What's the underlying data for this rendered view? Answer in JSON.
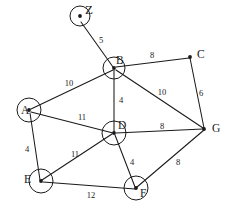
{
  "diagram": {
    "stroke_color": "#1a1a1a",
    "background_color": "#ffffff",
    "nodes": [
      {
        "id": "Z",
        "label": "Z",
        "x": 80,
        "y": 16,
        "shape": "circle",
        "radius": 10,
        "label_x": 85,
        "label_y": 11
      },
      {
        "id": "B",
        "label": "B",
        "x": 114,
        "y": 68,
        "shape": "circle",
        "radius": 11,
        "label_x": 116,
        "label_y": 61
      },
      {
        "id": "C",
        "label": "C",
        "x": 190,
        "y": 57,
        "shape": "dot",
        "radius": 0,
        "label_x": 197,
        "label_y": 55
      },
      {
        "id": "A",
        "label": "A",
        "x": 29,
        "y": 110,
        "shape": "circle",
        "radius": 12,
        "label_x": 21,
        "label_y": 111
      },
      {
        "id": "D",
        "label": "D",
        "x": 114,
        "y": 133,
        "shape": "circle",
        "radius": 12,
        "label_x": 118,
        "label_y": 126
      },
      {
        "id": "G",
        "label": "G",
        "x": 204,
        "y": 129,
        "shape": "dot",
        "radius": 0,
        "label_x": 212,
        "label_y": 129
      },
      {
        "id": "E",
        "label": "E",
        "x": 41,
        "y": 181,
        "shape": "circle",
        "radius": 12,
        "label_x": 24,
        "label_y": 180
      },
      {
        "id": "F",
        "label": "F",
        "x": 136,
        "y": 188,
        "shape": "circle",
        "radius": 12,
        "label_x": 140,
        "label_y": 194
      }
    ],
    "edges": [
      {
        "from": "Z",
        "to": "B",
        "weight": "5",
        "x1": 81,
        "y1": 22,
        "x2": 113,
        "y2": 67,
        "label_x": 101,
        "label_y": 41
      },
      {
        "from": "A",
        "to": "B",
        "weight": "10",
        "x1": 31,
        "y1": 109,
        "x2": 113,
        "y2": 70,
        "label_x": 69,
        "label_y": 84
      },
      {
        "from": "B",
        "to": "C",
        "weight": "8",
        "x1": 116,
        "y1": 67,
        "x2": 189,
        "y2": 58,
        "label_x": 152,
        "label_y": 56
      },
      {
        "from": "B",
        "to": "D",
        "weight": "4",
        "x1": 114,
        "y1": 70,
        "x2": 114,
        "y2": 132,
        "label_x": 121,
        "label_y": 101
      },
      {
        "from": "B",
        "to": "G",
        "weight": "10",
        "x1": 116,
        "y1": 70,
        "x2": 203,
        "y2": 128,
        "label_x": 162,
        "label_y": 93
      },
      {
        "from": "C",
        "to": "G",
        "weight": "6",
        "x1": 190,
        "y1": 58,
        "x2": 204,
        "y2": 128,
        "label_x": 201,
        "label_y": 94
      },
      {
        "from": "A",
        "to": "D",
        "weight": "11",
        "x1": 31,
        "y1": 112,
        "x2": 113,
        "y2": 133,
        "label_x": 82,
        "label_y": 118
      },
      {
        "from": "A",
        "to": "E",
        "weight": "4",
        "x1": 30,
        "y1": 113,
        "x2": 40,
        "y2": 180,
        "label_x": 27,
        "label_y": 150
      },
      {
        "from": "D",
        "to": "G",
        "weight": "8",
        "x1": 116,
        "y1": 133,
        "x2": 203,
        "y2": 129,
        "label_x": 162,
        "label_y": 127
      },
      {
        "from": "D",
        "to": "E",
        "weight": "11",
        "x1": 112,
        "y1": 134,
        "x2": 42,
        "y2": 180,
        "label_x": 75,
        "label_y": 155
      },
      {
        "from": "D",
        "to": "F",
        "weight": "4",
        "x1": 115,
        "y1": 135,
        "x2": 135,
        "y2": 187,
        "label_x": 132,
        "label_y": 163
      },
      {
        "from": "E",
        "to": "F",
        "weight": "12",
        "x1": 43,
        "y1": 182,
        "x2": 135,
        "y2": 189,
        "label_x": 91,
        "label_y": 196
      },
      {
        "from": "F",
        "to": "G",
        "weight": "8",
        "x1": 137,
        "y1": 187,
        "x2": 204,
        "y2": 130,
        "label_x": 178,
        "label_y": 163
      }
    ]
  }
}
